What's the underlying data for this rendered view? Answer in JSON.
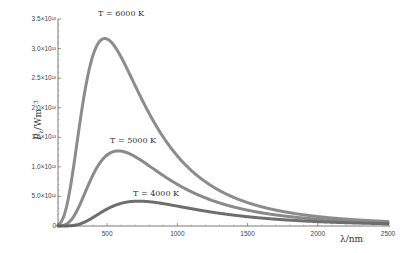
{
  "chart_data": {
    "type": "line",
    "title": "",
    "xlabel": "λ / nm",
    "ylabel": "P_λ / W m^-3",
    "xlim": [
      150,
      2500
    ],
    "ylim": [
      0,
      35000000000000.0
    ],
    "grid": false,
    "legend": "inline annotations",
    "x_ticks": [
      500,
      1000,
      1500,
      2000,
      2500
    ],
    "x_tick_labels": [
      "500",
      "1000",
      "1500",
      "2000",
      "2500"
    ],
    "y_ticks": [
      0,
      5000000000000.0,
      10000000000000.0,
      15000000000000.0,
      20000000000000.0,
      25000000000000.0,
      30000000000000.0,
      35000000000000.0
    ],
    "y_tick_labels": [
      "0",
      "5.0×10¹²",
      "1.0×10¹³",
      "1.5×10¹³",
      "2.0×10¹³",
      "2.5×10¹³",
      "3.0×10¹³",
      "3.5×10¹³"
    ],
    "series": [
      {
        "name": "T = 6000 K",
        "temperature_K": 6000,
        "peak_nm": 483,
        "peak_value": 31700000000000.0,
        "color": "#8c8c8c"
      },
      {
        "name": "T = 5000 K",
        "temperature_K": 5000,
        "peak_nm": 580,
        "peak_value": 12700000000000.0,
        "color": "#8a8a8a"
      },
      {
        "name": "T = 4000 K",
        "temperature_K": 4000,
        "peak_nm": 724,
        "peak_value": 4200000000000.0,
        "color": "#6e6e6e"
      }
    ],
    "annotations": [
      "T = 6000 K",
      "T = 5000 K",
      "T = 4000 K"
    ]
  },
  "labels": {
    "ylabel_main": "P",
    "ylabel_sub": "λ",
    "ylabel_unit": "/Wm",
    "ylabel_exp": "−3",
    "xlabel": "λ/nm",
    "ann_6000": "T = 6000 K",
    "ann_5000": "T = 5000 K",
    "ann_4000": "T = 4000 K"
  }
}
